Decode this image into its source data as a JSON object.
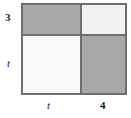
{
  "diagram": {
    "type": "area-model-grid",
    "colors": {
      "border": "#6e6e6e",
      "shaded": "#a8a8a8",
      "pale": "#f2f2f0",
      "light": "#f8f8f7",
      "text": "#1a1a1a"
    },
    "row_labels": [
      {
        "id": "row-top",
        "text": "3",
        "kind": "number"
      },
      {
        "id": "row-bottom",
        "text": "t",
        "kind": "variable"
      }
    ],
    "column_labels": [
      {
        "id": "col-left",
        "text": "t",
        "kind": "variable"
      },
      {
        "id": "col-right",
        "text": "4",
        "kind": "number"
      }
    ],
    "cells": [
      {
        "id": "cell-top-left",
        "row": "3",
        "col": "t",
        "fill": "shaded",
        "shaded": true
      },
      {
        "id": "cell-top-right",
        "row": "3",
        "col": "4",
        "fill": "pale",
        "shaded": false
      },
      {
        "id": "cell-bottom-left",
        "row": "t",
        "col": "t",
        "fill": "light",
        "shaded": false
      },
      {
        "id": "cell-bottom-right",
        "row": "t",
        "col": "4",
        "fill": "shaded",
        "shaded": true
      }
    ]
  }
}
